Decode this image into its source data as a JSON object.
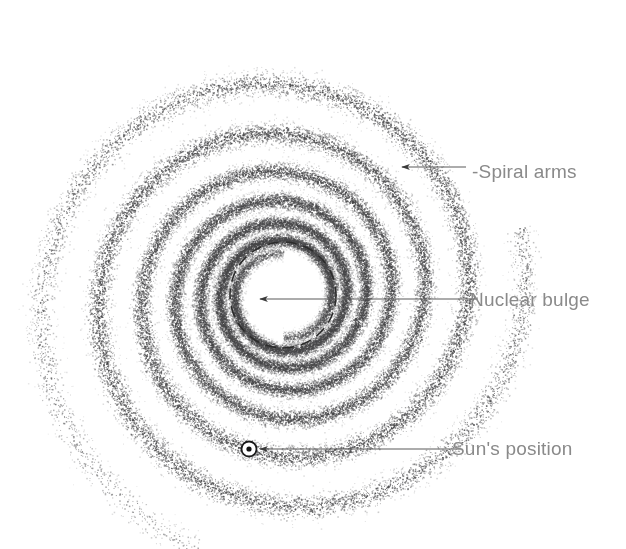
{
  "figure": {
    "background_color": "#ffffff",
    "width": 626,
    "height": 549
  },
  "galaxy": {
    "center": {
      "x": 283,
      "y": 295
    },
    "stipple_color": "#555555",
    "arm_count": 2,
    "turns": 3.45,
    "nuclear_bulge": {
      "radius": 53,
      "stroke_color": "#2b2b2b",
      "dash_pattern": "11 7",
      "stroke_width": 1.6
    },
    "sun_marker": {
      "symbol": "circled-dot",
      "x": 249,
      "y": 449,
      "outer_radius": 7.5,
      "inner_radius": 2.6,
      "color": "#1a1a1a"
    }
  },
  "annotations": {
    "leader_color": "#5a5a5a",
    "leader_width": 1.1,
    "items": [
      {
        "key": "spiral_arms",
        "label": "-Spiral arms",
        "text": "Spiral arms",
        "label_x": 472,
        "label_y": 162,
        "leader": {
          "x1": 466,
          "y1": 167,
          "x2": 400,
          "y2": 167
        },
        "arrow_at": {
          "x": 400,
          "y": 167
        }
      },
      {
        "key": "nuclear_bulge",
        "label": "Nuclear bulge",
        "text": "Nuclear bulge",
        "label_x": 470,
        "label_y": 290,
        "leader": {
          "x1": 478,
          "y1": 299,
          "x2": 258,
          "y2": 299
        },
        "arrow_at": {
          "x": 258,
          "y": 299
        }
      },
      {
        "key": "suns_position",
        "label": "Sun's position",
        "text": "Sun's position",
        "label_x": 452,
        "label_y": 439,
        "leader": {
          "x1": 460,
          "y1": 449,
          "x2": 258,
          "y2": 449
        },
        "arrow_at": {
          "x": 258,
          "y": 449
        }
      }
    ]
  },
  "labels": {
    "spiral_arms": "-Spiral arms",
    "nuclear_bulge": "Nuclear bulge",
    "suns_position": "Sun's position"
  }
}
